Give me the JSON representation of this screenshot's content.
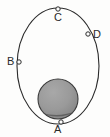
{
  "figure": {
    "kind": "orbit-diagram",
    "background_color": "#fdfdfc",
    "stroke_color": "#2b2b2b",
    "body_fill_color": "#9a9a9a",
    "body_shadow_color": "#5c5c5c"
  },
  "orbit": {
    "name": "elliptical-orbit-path",
    "center_x": 58,
    "center_y": 66,
    "radius_x": 41,
    "radius_y": 58,
    "stroke_width": "1"
  },
  "central_body": {
    "name": "shaded-sphere",
    "center_x": 58,
    "center_y": 99,
    "radius": 20
  },
  "points": [
    {
      "label": "A",
      "marker_x": 61,
      "marker_y": 122,
      "label_x": 54,
      "label_y": 124
    },
    {
      "label": "B",
      "marker_x": 19,
      "marker_y": 62,
      "label_x": 7,
      "label_y": 56
    },
    {
      "label": "C",
      "marker_x": 58,
      "marker_y": 9,
      "label_x": 54,
      "label_y": 12
    },
    {
      "label": "D",
      "marker_x": 88,
      "marker_y": 34,
      "label_x": 93,
      "label_y": 29
    }
  ]
}
